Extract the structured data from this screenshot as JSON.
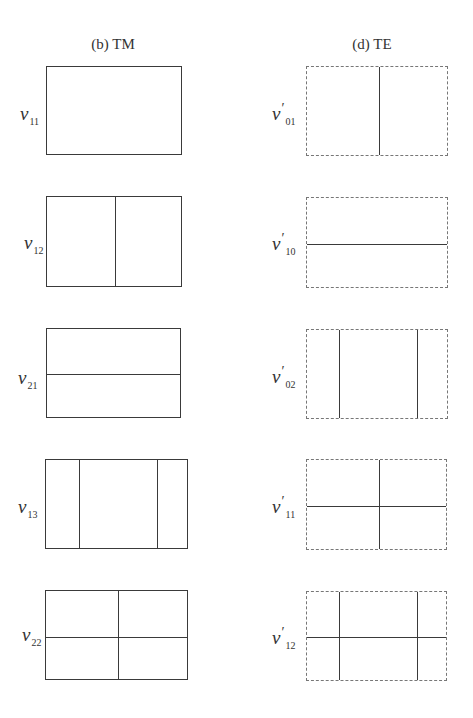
{
  "columns": [
    {
      "title": "(b) TM",
      "title_x": 113,
      "line_style": "solid",
      "modes": [
        {
          "symbol": "v",
          "prime": "",
          "subscript": "11",
          "label_x": 20,
          "label_y": 104,
          "box": {
            "x": 46,
            "y": 66,
            "w": 136,
            "h": 89
          },
          "vlines": [],
          "hlines": []
        },
        {
          "symbol": "v",
          "prime": "",
          "subscript": "12",
          "label_x": 24,
          "label_y": 233,
          "box": {
            "x": 46,
            "y": 196,
            "w": 136,
            "h": 91
          },
          "vlines": [
            68
          ],
          "hlines": []
        },
        {
          "symbol": "v",
          "prime": "",
          "subscript": "21",
          "label_x": 18,
          "label_y": 368,
          "box": {
            "x": 46,
            "y": 328,
            "w": 135,
            "h": 90
          },
          "vlines": [],
          "hlines": [
            45
          ]
        },
        {
          "symbol": "v",
          "prime": "",
          "subscript": "13",
          "label_x": 18,
          "label_y": 497,
          "box": {
            "x": 45,
            "y": 459,
            "w": 143,
            "h": 90
          },
          "vlines": [
            33,
            111
          ],
          "hlines": []
        },
        {
          "symbol": "v",
          "prime": "",
          "subscript": "22",
          "label_x": 22,
          "label_y": 625,
          "box": {
            "x": 45,
            "y": 590,
            "w": 143,
            "h": 90
          },
          "vlines": [
            72
          ],
          "hlines": [
            46
          ]
        }
      ]
    },
    {
      "title": "(d) TE",
      "title_x": 372,
      "line_style": "dashed",
      "modes": [
        {
          "symbol": "v",
          "prime": "′",
          "subscript": "01",
          "label_x": 272,
          "label_y": 104,
          "box": {
            "x": 306,
            "y": 66,
            "w": 142,
            "h": 90
          },
          "vlines": [
            72
          ],
          "hlines": []
        },
        {
          "symbol": "v",
          "prime": "′",
          "subscript": "10",
          "label_x": 272,
          "label_y": 234,
          "box": {
            "x": 306,
            "y": 197,
            "w": 142,
            "h": 91
          },
          "vlines": [],
          "hlines": [
            46
          ]
        },
        {
          "symbol": "v",
          "prime": "′",
          "subscript": "02",
          "label_x": 272,
          "label_y": 367,
          "box": {
            "x": 306,
            "y": 329,
            "w": 142,
            "h": 90
          },
          "vlines": [
            32,
            110
          ],
          "hlines": []
        },
        {
          "symbol": "v",
          "prime": "′",
          "subscript": "11",
          "label_x": 272,
          "label_y": 497,
          "box": {
            "x": 306,
            "y": 459,
            "w": 141,
            "h": 91
          },
          "vlines": [
            72
          ],
          "hlines": [
            46
          ]
        },
        {
          "symbol": "v",
          "prime": "′",
          "subscript": "12",
          "label_x": 272,
          "label_y": 628,
          "box": {
            "x": 306,
            "y": 591,
            "w": 141,
            "h": 90
          },
          "vlines": [
            32,
            110
          ],
          "hlines": [
            45
          ]
        }
      ]
    }
  ]
}
